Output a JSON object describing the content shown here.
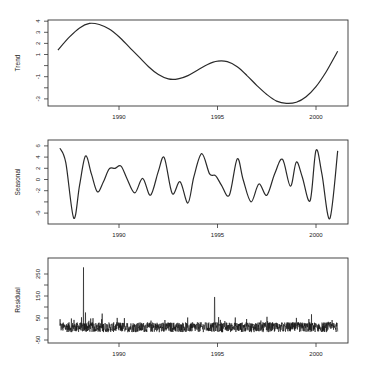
{
  "chart_data": [
    {
      "type": "line",
      "title": "",
      "ylabel": "Trend",
      "xlabel": "",
      "x_ticks": [
        1990,
        1995,
        2000
      ],
      "y_ticks": [
        -3,
        -2,
        -1,
        0,
        1,
        2,
        3,
        4
      ],
      "y_tick_labels": [
        "-3",
        "",
        "-1",
        "",
        "1",
        "2",
        "3",
        "4"
      ],
      "xlim": [
        1986.5,
        2001.6
      ],
      "ylim": [
        -3.6,
        4.1
      ],
      "grid": false,
      "x": [
        1986.9,
        1987.5,
        1988.0,
        1988.5,
        1989.0,
        1989.5,
        1990.0,
        1990.5,
        1991.0,
        1991.5,
        1992.0,
        1992.5,
        1993.0,
        1993.5,
        1994.0,
        1994.5,
        1995.0,
        1995.5,
        1996.0,
        1996.5,
        1997.0,
        1997.5,
        1998.0,
        1998.5,
        1999.0,
        1999.5,
        2000.0,
        2000.5,
        2001.1
      ],
      "values": [
        1.4,
        2.6,
        3.4,
        3.8,
        3.7,
        3.3,
        2.6,
        1.7,
        0.8,
        -0.1,
        -0.8,
        -1.2,
        -1.2,
        -0.9,
        -0.4,
        0.1,
        0.4,
        0.35,
        -0.1,
        -0.9,
        -1.8,
        -2.6,
        -3.2,
        -3.4,
        -3.3,
        -2.8,
        -1.9,
        -0.6,
        1.3
      ]
    },
    {
      "type": "line",
      "title": "",
      "ylabel": "Seasonal",
      "xlabel": "",
      "x_ticks": [
        1990,
        1995,
        2000
      ],
      "y_ticks": [
        -6,
        -4,
        -2,
        0,
        2,
        4,
        6
      ],
      "y_tick_labels": [
        "-6",
        "",
        "-2",
        "0",
        "2",
        "4",
        "6"
      ],
      "xlim": [
        1986.5,
        2001.6
      ],
      "ylim": [
        -7.5,
        6.2
      ],
      "grid": false,
      "x": [
        1987.0,
        1987.3,
        1987.7,
        1988.0,
        1988.3,
        1988.6,
        1988.9,
        1989.2,
        1989.5,
        1989.8,
        1990.1,
        1990.4,
        1990.8,
        1991.2,
        1991.6,
        1992.0,
        1992.3,
        1992.7,
        1993.1,
        1993.5,
        1993.8,
        1994.2,
        1994.6,
        1994.9,
        1995.2,
        1995.6,
        1996.0,
        1996.3,
        1996.7,
        1997.1,
        1997.5,
        1997.9,
        1998.3,
        1998.7,
        1999.0,
        1999.3,
        1999.7,
        2000.0,
        2000.3,
        2000.7,
        2001.1
      ],
      "values": [
        5.6,
        3.0,
        -6.9,
        -1.0,
        4.2,
        1.0,
        -2.2,
        -0.5,
        1.9,
        2.0,
        2.4,
        0.2,
        -2.4,
        0.2,
        -2.8,
        1.5,
        3.9,
        -2.5,
        -0.4,
        -4.2,
        0.5,
        4.6,
        1.0,
        0.7,
        -1.0,
        -2.8,
        3.7,
        0.0,
        -4.0,
        -0.8,
        -2.8,
        1.0,
        3.6,
        -1.2,
        3.1,
        0.5,
        -3.8,
        5.2,
        1.0,
        -7.0,
        5.1
      ]
    },
    {
      "type": "line",
      "title": "",
      "ylabel": "Residual",
      "xlabel": "",
      "x_ticks": [
        1990,
        1995,
        2000
      ],
      "y_ticks": [
        -50,
        0,
        50,
        100,
        150,
        200,
        250
      ],
      "y_tick_labels": [
        "-50",
        "",
        "50",
        "",
        "150",
        "",
        "250"
      ],
      "xlim": [
        1986.5,
        2001.6
      ],
      "ylim": [
        -60,
        290
      ],
      "grid": false,
      "notes": "Dense high-frequency noise roughly between -40 and 60; large spikes near 1988.2 (~280) and 1994.8 (~145)",
      "spikes": [
        {
          "x": 1988.2,
          "y": 280
        },
        {
          "x": 1988.3,
          "y": 75
        },
        {
          "x": 1994.85,
          "y": 145
        }
      ],
      "typical_range": [
        -40,
        60
      ]
    }
  ],
  "panels": {
    "trend": {
      "ylabel": "Trend"
    },
    "seasonal": {
      "ylabel": "Seasonal"
    },
    "residual": {
      "ylabel": "Residual"
    }
  },
  "x_tick_labels": [
    "1990",
    "1995",
    "2000"
  ]
}
